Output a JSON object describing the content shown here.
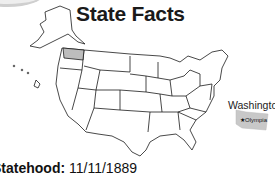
{
  "title": "State Facts",
  "highlight_state": "Washington",
  "capital": "Olympia",
  "statehood_label": "Statehood:",
  "statehood_date": "11/11/1889",
  "colors": {
    "highlight": "#bdbdbd",
    "outline": "#1a1a1a",
    "background": "#ffffff"
  }
}
